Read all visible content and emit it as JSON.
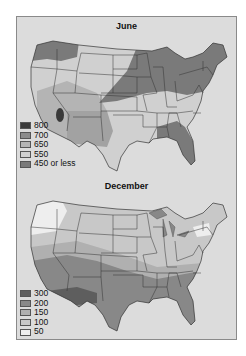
{
  "figure": {
    "june": {
      "title": "June",
      "legend": [
        {
          "label": "800",
          "color": "#3a3a3a"
        },
        {
          "label": "700",
          "color": "#8c8c8c"
        },
        {
          "label": "650",
          "color": "#b4b4b4"
        },
        {
          "label": "550",
          "color": "#d0d0d0"
        },
        {
          "label": "450 or less",
          "color": "#7a7a7a"
        }
      ]
    },
    "december": {
      "title": "December",
      "legend": [
        {
          "label": "300",
          "color": "#5e5e5e"
        },
        {
          "label": "200",
          "color": "#888888"
        },
        {
          "label": "150",
          "color": "#b0b0b0"
        },
        {
          "label": "100",
          "color": "#c8c8c8"
        },
        {
          "label": "50",
          "color": "#eeeeee"
        }
      ]
    }
  }
}
